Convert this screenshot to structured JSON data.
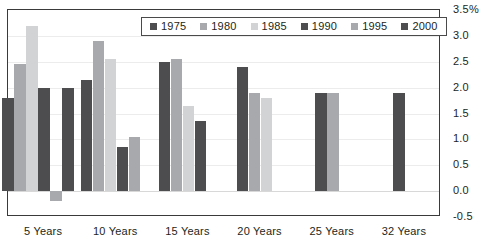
{
  "chart_data": {
    "type": "bar",
    "title": "",
    "subtitle": "",
    "xlabel": "",
    "ylabel": "",
    "grid": true,
    "legend_position": "top-center",
    "categories": [
      "5 Years",
      "10 Years",
      "15 Years",
      "20 Years",
      "25 Years",
      "32 Years"
    ],
    "ylim": [
      -0.5,
      3.5
    ],
    "ytick_labels": [
      "3.5%",
      "3.0",
      "2.5",
      "2.0",
      "1.5",
      "1.0",
      "0.5",
      "0.0",
      "-0.5"
    ],
    "ytick_values": [
      3.5,
      3.0,
      2.5,
      2.0,
      1.5,
      1.0,
      0.5,
      0.0,
      -0.5
    ],
    "series": [
      {
        "name": "1975",
        "color": "#4d4d4f",
        "values": [
          1.8,
          2.15,
          2.5,
          2.4,
          1.9,
          null
        ]
      },
      {
        "name": "1980",
        "color": "#a7a9ac",
        "values": [
          2.45,
          2.9,
          2.55,
          1.9,
          null,
          null
        ]
      },
      {
        "name": "1985",
        "color": "#d1d3d4",
        "values": [
          3.2,
          2.55,
          1.65,
          1.8,
          null,
          null
        ]
      },
      {
        "name": "1990",
        "color": "#4d4d4f",
        "values": [
          2.0,
          0.85,
          1.35,
          null,
          null,
          null
        ]
      },
      {
        "name": "1995",
        "color": "#a7a9ac",
        "values": [
          -0.2,
          1.05,
          null,
          null,
          1.9,
          null
        ]
      },
      {
        "name": "2000",
        "color": "#4d4d4f",
        "values": [
          2.0,
          null,
          null,
          null,
          null,
          1.9
        ]
      }
    ]
  },
  "legend": {
    "entries": [
      {
        "label": "1975"
      },
      {
        "label": "1980"
      },
      {
        "label": "1985"
      },
      {
        "label": "1990"
      },
      {
        "label": "1995"
      },
      {
        "label": "2000"
      }
    ]
  }
}
